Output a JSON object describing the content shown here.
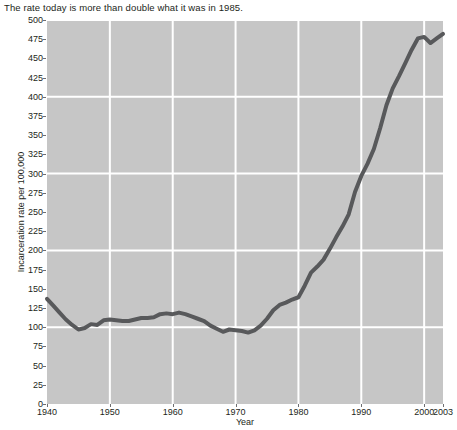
{
  "title": "The rate today is more than double what it was in 1985.",
  "axes": {
    "xlabel": "Year",
    "ylabel": "Incarceration rate per 100,000",
    "ytick_labels": [
      "500",
      "475",
      "450",
      "425",
      "400",
      "375",
      "350",
      "325",
      "300",
      "275",
      "250",
      "225",
      "200",
      "175",
      "150",
      "125",
      "100",
      "75",
      "50",
      "25",
      "0"
    ],
    "xtick_labels": [
      "1940",
      "1950",
      "1960",
      "1970",
      "1980",
      "1990",
      "2000",
      "2003"
    ]
  },
  "colors": {
    "plot_background": "#c6c6c6",
    "gridline": "#ffffff",
    "line": "#58595b",
    "text": "#231f20",
    "page_background": "#ffffff"
  },
  "chart_data": {
    "type": "line",
    "title": "The rate today is more than double what it was in 1985.",
    "xlabel": "Year",
    "ylabel": "Incarceration rate per 100,000",
    "xlim": [
      1940,
      2003
    ],
    "ylim": [
      0,
      500
    ],
    "ytick_interval": 25,
    "ygrid_interval": 100,
    "xtick_interval": 10,
    "grid": true,
    "legend": false,
    "series": [
      {
        "name": "Incarceration rate per 100,000",
        "x": [
          1940,
          1941,
          1942,
          1943,
          1944,
          1945,
          1946,
          1947,
          1948,
          1949,
          1950,
          1951,
          1952,
          1953,
          1954,
          1955,
          1956,
          1957,
          1958,
          1959,
          1960,
          1961,
          1962,
          1963,
          1964,
          1965,
          1966,
          1967,
          1968,
          1969,
          1970,
          1971,
          1972,
          1973,
          1974,
          1975,
          1976,
          1977,
          1978,
          1979,
          1980,
          1981,
          1982,
          1983,
          1984,
          1985,
          1986,
          1987,
          1988,
          1989,
          1990,
          1991,
          1992,
          1993,
          1994,
          1995,
          1996,
          1997,
          1998,
          1999,
          2000,
          2001,
          2002,
          2003
        ],
        "y": [
          137,
          128,
          119,
          110,
          103,
          97,
          99,
          104,
          103,
          109,
          110,
          109,
          108,
          108,
          110,
          112,
          112,
          113,
          117,
          118,
          117,
          119,
          117,
          114,
          111,
          108,
          102,
          98,
          94,
          97,
          96,
          95,
          93,
          96,
          102,
          111,
          122,
          129,
          132,
          136,
          139,
          154,
          171,
          179,
          188,
          202,
          217,
          231,
          247,
          276,
          297,
          313,
          332,
          359,
          389,
          411,
          427,
          444,
          461,
          476,
          478,
          470,
          476,
          482
        ]
      }
    ]
  }
}
